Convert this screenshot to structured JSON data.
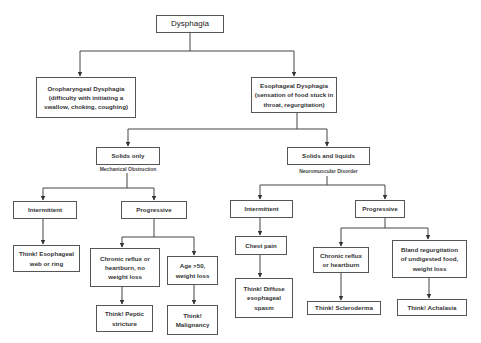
{
  "diagram": {
    "title": "Dysphagia",
    "nodes": {
      "root": "Dysphagia",
      "oropharyngeal": "Oropharyngeal Dysphagia\n(difficulty with initiating a\nswallow, choking, coughing)",
      "esophageal": "Esophageal Dysphagia\n(sensation of food stuck in\nthroat, regurgitation)",
      "solids_only": "Solids only",
      "solids_only_sub": "Mechanical Obstruction",
      "solids_liquids": "Solids and liquids",
      "solids_liquids_sub": "Neuromuscular Disorder",
      "mech_intermittent": "Intermittent",
      "mech_progressive": "Progressive",
      "think_web": "Think! Esophageal\nweb or ring",
      "chronic_reflux_no_wl": "Chronic reflux or\nheartburn, no\nweight loss",
      "age_50": "Age >50,\nweight loss",
      "think_peptic": "Think! Peptic\nstricture",
      "think_malignancy": "Think!\nMalignancy",
      "nm_intermittent": "Intermittent",
      "chest_pain": "Chest pain",
      "think_diffuse": "Think! Diffuse\nesophageal\nspasm",
      "nm_progressive": "Progressive",
      "chronic_reflux": "Chronic reflux\nor heartburn",
      "bland_regurg": "Bland regurgitation\nof undigested food,\nweight loss",
      "think_scleroderma": "Think! Scleroderma",
      "think_achalasia": "Think! Achalasia"
    },
    "edges": [
      [
        "root",
        "oropharyngeal"
      ],
      [
        "root",
        "esophageal"
      ],
      [
        "esophageal",
        "solids_only"
      ],
      [
        "esophageal",
        "solids_liquids"
      ],
      [
        "solids_only",
        "mech_intermittent"
      ],
      [
        "solids_only",
        "mech_progressive"
      ],
      [
        "mech_intermittent",
        "think_web"
      ],
      [
        "mech_progressive",
        "chronic_reflux_no_wl"
      ],
      [
        "mech_progressive",
        "age_50"
      ],
      [
        "chronic_reflux_no_wl",
        "think_peptic"
      ],
      [
        "age_50",
        "think_malignancy"
      ],
      [
        "solids_liquids",
        "nm_intermittent"
      ],
      [
        "solids_liquids",
        "nm_progressive"
      ],
      [
        "nm_intermittent",
        "chest_pain"
      ],
      [
        "chest_pain",
        "think_diffuse"
      ],
      [
        "nm_progressive",
        "chronic_reflux"
      ],
      [
        "nm_progressive",
        "bland_regurg"
      ],
      [
        "chronic_reflux",
        "think_scleroderma"
      ],
      [
        "bland_regurg",
        "think_achalasia"
      ]
    ]
  }
}
